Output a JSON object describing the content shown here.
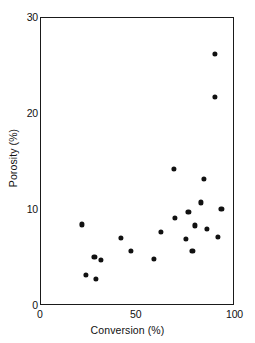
{
  "chart_data": {
    "type": "scatter",
    "title": "",
    "xlabel": "Conversion (%)",
    "ylabel": "Porosity (%)",
    "xlim": [
      0,
      100
    ],
    "ylim": [
      0,
      30
    ],
    "xticks": [
      0,
      50,
      100
    ],
    "xtick_labels": [
      "0",
      "50",
      "100"
    ],
    "yticks": [
      0,
      10,
      20,
      30
    ],
    "ytick_labels": [
      "0",
      "10",
      "20",
      "30"
    ],
    "grid": false,
    "legend": null,
    "marker": "filled-circle",
    "marker_color": "#111111",
    "series": [
      {
        "name": "samples",
        "points": [
          {
            "x": 21.0,
            "y": 8.5
          },
          {
            "x": 23.0,
            "y": 3.2
          },
          {
            "x": 27.5,
            "y": 5.1
          },
          {
            "x": 28.5,
            "y": 2.8
          },
          {
            "x": 31.0,
            "y": 4.8
          },
          {
            "x": 41.0,
            "y": 7.1
          },
          {
            "x": 46.5,
            "y": 5.7
          },
          {
            "x": 58.0,
            "y": 4.9
          },
          {
            "x": 62.0,
            "y": 7.7
          },
          {
            "x": 68.5,
            "y": 14.3
          },
          {
            "x": 69.0,
            "y": 9.2
          },
          {
            "x": 74.5,
            "y": 7.0
          },
          {
            "x": 76.0,
            "y": 9.8
          },
          {
            "x": 78.0,
            "y": 5.7
          },
          {
            "x": 79.5,
            "y": 8.4
          },
          {
            "x": 82.5,
            "y": 10.8
          },
          {
            "x": 84.0,
            "y": 13.2
          },
          {
            "x": 85.5,
            "y": 8.0
          },
          {
            "x": 89.5,
            "y": 21.8
          },
          {
            "x": 89.5,
            "y": 26.3
          },
          {
            "x": 91.0,
            "y": 7.2
          },
          {
            "x": 93.0,
            "y": 10.1
          }
        ]
      }
    ]
  },
  "axes": {
    "x": {
      "title": "Conversion (%)",
      "tick_labels": [
        "0",
        "50",
        "100"
      ]
    },
    "y": {
      "title": "Porosity (%)",
      "tick_labels": [
        "0",
        "10",
        "20",
        "30"
      ]
    }
  }
}
